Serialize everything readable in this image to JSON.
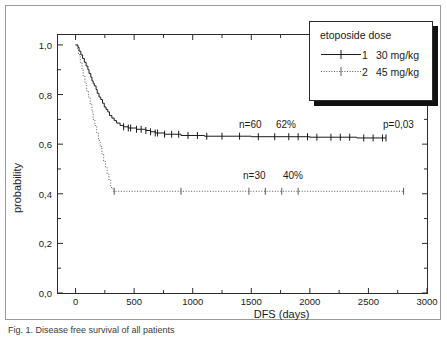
{
  "figure": {
    "caption": "Fig. 1. Disease free survival of all patients"
  },
  "axes": {
    "ylabel": "probability",
    "xlabel": "DFS (days)",
    "yticks": [
      "0,0",
      "0,2",
      "0,4",
      "0,6",
      "0,8",
      "1,0"
    ],
    "ytick_values": [
      0,
      0.2,
      0.4,
      0.6,
      0.8,
      1.0
    ],
    "xticks": [
      "0",
      "500",
      "1000",
      "1500",
      "2000",
      "2500",
      "3000"
    ],
    "xtick_values": [
      0,
      500,
      1000,
      1500,
      2000,
      2500,
      3000
    ]
  },
  "legend": {
    "title": "etoposide dose",
    "entries": [
      {
        "key": "1",
        "dose": "30 mg/kg",
        "style": "solid"
      },
      {
        "key": "2",
        "dose": "45 mg/kg",
        "style": "dotted"
      }
    ]
  },
  "annotations": {
    "group1_n": "n=60",
    "group1_pct": "62%",
    "group2_n": "n=30",
    "group2_pct": "40%",
    "pvalue": "p=0,03"
  },
  "chart_data": {
    "type": "line",
    "title": "",
    "xlabel": "DFS (days)",
    "ylabel": "probability",
    "xlim": [
      -150,
      3000
    ],
    "ylim": [
      0.0,
      1.04
    ],
    "grid": false,
    "legend_position": "top-right",
    "pvalue": 0.03,
    "series": [
      {
        "name": "etoposide dose 1 — 30 mg/kg",
        "n": 60,
        "plateau_probability": 0.62,
        "plateau_label": "62%",
        "style": "solid",
        "color": "#1a1a1a",
        "steps": [
          [
            0,
            1.0
          ],
          [
            20,
            0.99
          ],
          [
            30,
            0.975
          ],
          [
            45,
            0.96
          ],
          [
            60,
            0.945
          ],
          [
            75,
            0.93
          ],
          [
            90,
            0.915
          ],
          [
            105,
            0.9
          ],
          [
            115,
            0.885
          ],
          [
            130,
            0.87
          ],
          [
            140,
            0.855
          ],
          [
            150,
            0.845
          ],
          [
            160,
            0.835
          ],
          [
            175,
            0.82
          ],
          [
            185,
            0.805
          ],
          [
            200,
            0.79
          ],
          [
            215,
            0.78
          ],
          [
            230,
            0.765
          ],
          [
            245,
            0.75
          ],
          [
            260,
            0.74
          ],
          [
            275,
            0.73
          ],
          [
            290,
            0.715
          ],
          [
            310,
            0.705
          ],
          [
            330,
            0.695
          ],
          [
            350,
            0.685
          ],
          [
            380,
            0.675
          ],
          [
            410,
            0.67
          ],
          [
            450,
            0.665
          ],
          [
            520,
            0.66
          ],
          [
            600,
            0.655
          ],
          [
            640,
            0.65
          ],
          [
            680,
            0.645
          ],
          [
            760,
            0.64
          ],
          [
            900,
            0.635
          ],
          [
            1100,
            0.632
          ],
          [
            1500,
            0.63
          ],
          [
            2000,
            0.628
          ],
          [
            2400,
            0.625
          ],
          [
            2650,
            0.625
          ]
        ],
        "censor_times": [
          410,
          450,
          470,
          520,
          560,
          600,
          640,
          680,
          700,
          760,
          820,
          880,
          960,
          1040,
          1120,
          1250,
          1400,
          1560,
          1700,
          1820,
          1900,
          1980,
          2060,
          2180,
          2260,
          2340,
          2460,
          2540,
          2620,
          2650
        ]
      },
      {
        "name": "etoposide dose 2 — 45 mg/kg",
        "n": 30,
        "plateau_probability": 0.41,
        "plateau_label": "40%",
        "style": "dotted",
        "color": "#5a5a5a",
        "steps": [
          [
            0,
            1.0
          ],
          [
            15,
            0.985
          ],
          [
            25,
            0.96
          ],
          [
            40,
            0.93
          ],
          [
            55,
            0.9
          ],
          [
            65,
            0.875
          ],
          [
            80,
            0.845
          ],
          [
            95,
            0.815
          ],
          [
            110,
            0.79
          ],
          [
            125,
            0.76
          ],
          [
            140,
            0.73
          ],
          [
            150,
            0.7
          ],
          [
            165,
            0.675
          ],
          [
            180,
            0.645
          ],
          [
            195,
            0.615
          ],
          [
            210,
            0.59
          ],
          [
            225,
            0.56
          ],
          [
            240,
            0.53
          ],
          [
            255,
            0.505
          ],
          [
            270,
            0.48
          ],
          [
            285,
            0.455
          ],
          [
            300,
            0.425
          ],
          [
            320,
            0.41
          ],
          [
            2800,
            0.41
          ]
        ],
        "censor_times": [
          330,
          900,
          1480,
          1620,
          1760,
          1900,
          2800
        ]
      }
    ]
  }
}
